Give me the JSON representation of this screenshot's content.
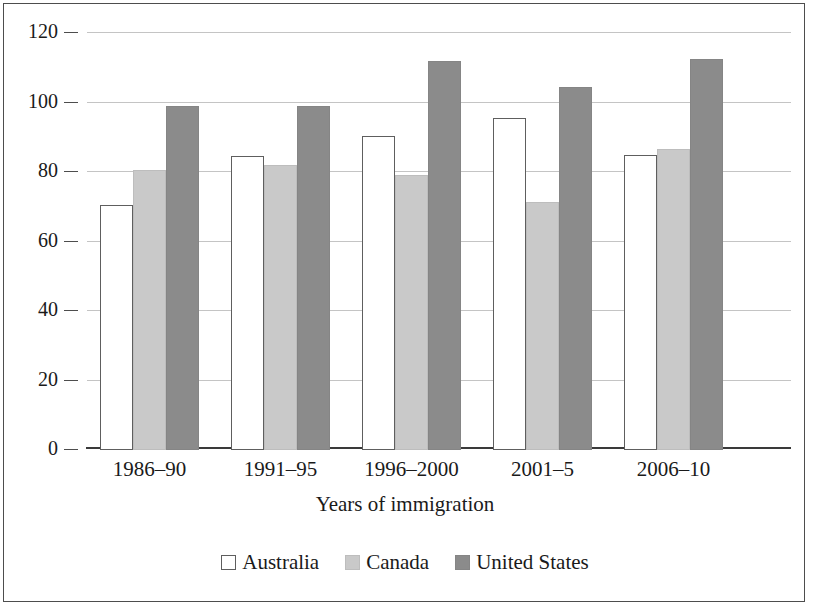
{
  "chart_data": {
    "type": "bar",
    "title": "",
    "subtitle": "",
    "xlabel": "Years of immigration",
    "ylabel": "",
    "categories": [
      "1986–90",
      "1991–95",
      "1996–2000",
      "2001–5",
      "2006–10"
    ],
    "series": [
      {
        "name": "Australia",
        "values": [
          70.5,
          84.5,
          90.5,
          95.5,
          85.0
        ],
        "color": "#ffffff"
      },
      {
        "name": "Canada",
        "values": [
          80.5,
          82.0,
          79.0,
          71.5,
          86.5
        ],
        "color": "#c9c9c9"
      },
      {
        "name": "United States",
        "values": [
          99.0,
          99.0,
          112.0,
          104.5,
          112.5
        ],
        "color": "#8b8b8b"
      }
    ],
    "ylim": [
      0,
      120
    ],
    "yticks": [
      0,
      20,
      40,
      60,
      80,
      100,
      120
    ],
    "ytick_labels": [
      "0",
      "20",
      "40",
      "60",
      "80",
      "100",
      "120"
    ],
    "grid": true,
    "grid_axis": "y",
    "legend_position": "bottom",
    "bar_edge_color": "#5e5e5e",
    "grid_color": "#c4c4c4",
    "axis_color": "#3a3a3a",
    "frame_color": "#4d4d4d"
  }
}
